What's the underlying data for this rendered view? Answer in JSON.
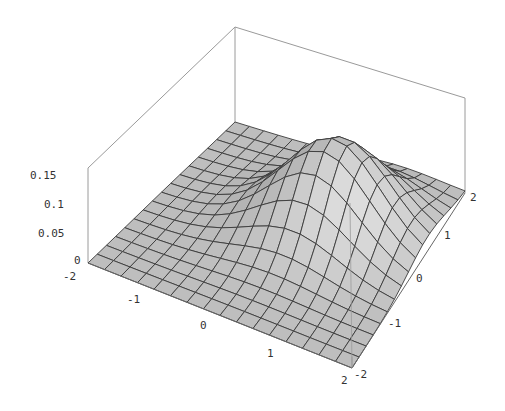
{
  "chart_data": {
    "type": "surface3d",
    "title": "",
    "function_description": "Gaussian bump centered near (x=0.5, y=0.5) with small asymmetric skew, peak value ~0.16",
    "x_range": [
      -2,
      2
    ],
    "y_range": [
      -2,
      2
    ],
    "z_range": [
      0,
      0.17
    ],
    "x_ticks": [
      "-2",
      "-1",
      "0",
      "1",
      "2"
    ],
    "y_ticks": [
      "-2",
      "-1",
      "0",
      "1",
      "2"
    ],
    "z_ticks": [
      "0",
      "0.05",
      "0.1",
      "0.15"
    ],
    "grid_points": 16,
    "peak": {
      "x": 0.6,
      "y": 0.4,
      "z": 0.16
    },
    "box": true,
    "surface_color": "#bdbdbd",
    "mesh_color": "#3a3a3a",
    "box_color": "#9a9a9a"
  }
}
